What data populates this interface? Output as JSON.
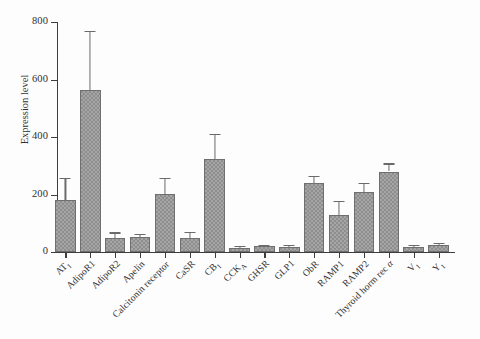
{
  "chart_data": {
    "type": "bar",
    "title": "",
    "subtitle": "",
    "xlabel": "",
    "ylabel": "Expression level",
    "ylim": [
      0,
      800
    ],
    "yticks": [
      0,
      200,
      400,
      600,
      800
    ],
    "ytick_labels": [
      "0",
      "200",
      "400",
      "600",
      "800"
    ],
    "grid": false,
    "legend": null,
    "error_bars": "upper-only",
    "bar_color": "#8e8e8e",
    "bar_edge_color": "#6f6f6f",
    "axis_color": "#3d3d3d",
    "categories": [
      "AT1",
      "AdipoR1",
      "AdipoR2",
      "Apelin",
      "Calcitonin receptor",
      "CaSR",
      "CB1",
      "CCKA",
      "GHSR",
      "GLP1",
      "ObR",
      "RAMP1",
      "RAMP2",
      "Thyroid horm rec a",
      "V1",
      "Y1"
    ],
    "category_labels": [
      {
        "base": "AT",
        "sub": "1",
        "italic_tail": ""
      },
      {
        "base": "AdipoR1",
        "sub": "",
        "italic_tail": ""
      },
      {
        "base": "AdipoR2",
        "sub": "",
        "italic_tail": ""
      },
      {
        "base": "Apelin",
        "sub": "",
        "italic_tail": ""
      },
      {
        "base": "Calcitonin receptor",
        "sub": "",
        "italic_tail": ""
      },
      {
        "base": "CaSR",
        "sub": "",
        "italic_tail": ""
      },
      {
        "base": "CB",
        "sub": "1",
        "italic_tail": ""
      },
      {
        "base": "CCK",
        "sub": "A",
        "italic_tail": ""
      },
      {
        "base": "GHSR",
        "sub": "",
        "italic_tail": ""
      },
      {
        "base": "GLP1",
        "sub": "",
        "italic_tail": ""
      },
      {
        "base": "ObR",
        "sub": "",
        "italic_tail": ""
      },
      {
        "base": "RAMP1",
        "sub": "",
        "italic_tail": ""
      },
      {
        "base": "RAMP2",
        "sub": "",
        "italic_tail": ""
      },
      {
        "base": "Thyroid horm rec ",
        "sub": "",
        "italic_tail": "α"
      },
      {
        "base": "V",
        "sub": "1",
        "italic_tail": ""
      },
      {
        "base": "Y",
        "sub": "1",
        "italic_tail": ""
      }
    ],
    "values": [
      180,
      562,
      50,
      52,
      202,
      50,
      322,
      14,
      20,
      19,
      240,
      128,
      208,
      280,
      16,
      26
    ],
    "error_upper": [
      78,
      208,
      18,
      10,
      56,
      20,
      90,
      6,
      6,
      6,
      25,
      50,
      32,
      28,
      8,
      6
    ],
    "error_top_values": [
      258,
      770,
      68,
      62,
      258,
      70,
      412,
      20,
      26,
      25,
      265,
      178,
      240,
      308,
      24,
      32
    ]
  }
}
